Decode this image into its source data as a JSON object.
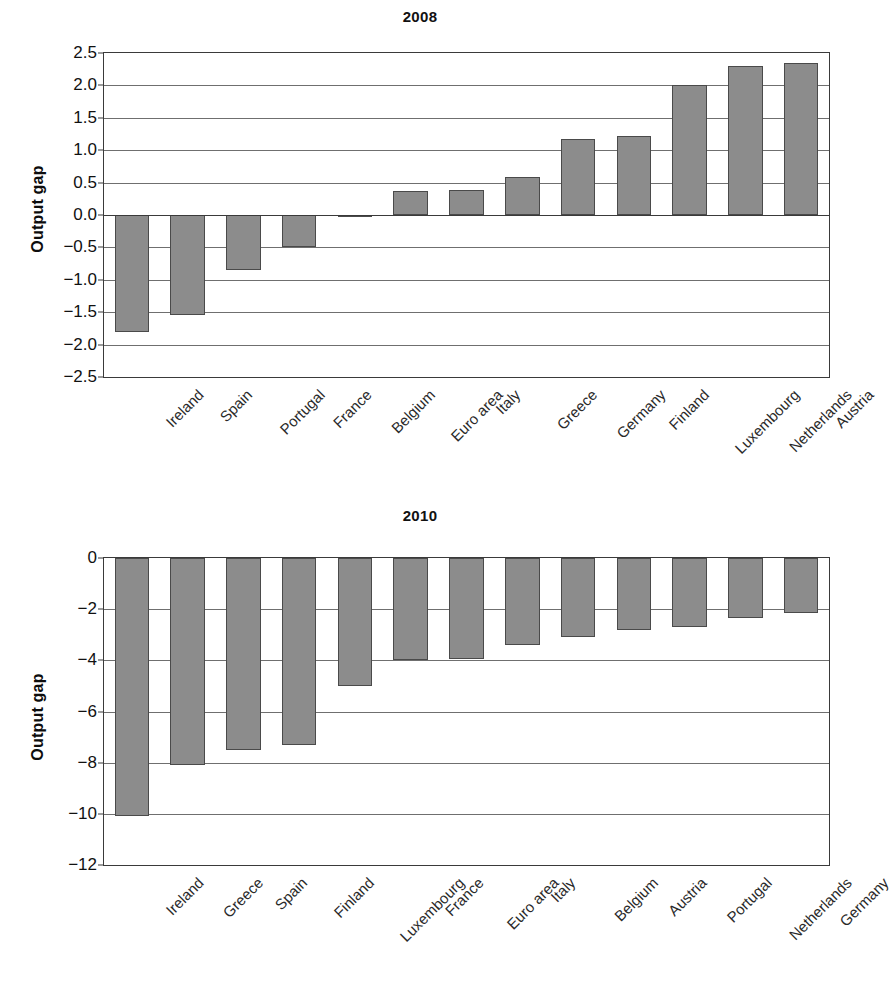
{
  "figure": {
    "background_color": "#ffffff",
    "bar_fill_color": "#8c8c8c",
    "bar_border_color": "#4a4a4a",
    "axis_color": "#3a3a3a",
    "grid_color": "#6f6f6f"
  },
  "charts": [
    {
      "id": "chart-2008",
      "title": "2008",
      "ylabel": "Output gap",
      "yticks": [
        "2.5",
        "2.0",
        "1.5",
        "1.0",
        "0.5",
        "0.0",
        "−0.5",
        "−1.0",
        "−1.5",
        "−2.0",
        "−2.5"
      ]
    },
    {
      "id": "chart-2010",
      "title": "2010",
      "ylabel": "Output gap",
      "yticks": [
        "0",
        "−2",
        "−4",
        "−6",
        "−8",
        "−10",
        "−12"
      ]
    }
  ],
  "chart_data": [
    {
      "type": "bar",
      "title": "2008",
      "xlabel": "",
      "ylabel": "Output gap",
      "ylim": [
        -2.5,
        2.5
      ],
      "ytick_values": [
        2.5,
        2.0,
        1.5,
        1.0,
        0.5,
        0.0,
        -0.5,
        -1.0,
        -1.5,
        -2.0,
        -2.5
      ],
      "grid": true,
      "legend": "none",
      "categories": [
        "Ireland",
        "Spain",
        "Portugal",
        "France",
        "Belgium",
        "Euro area",
        "Italy",
        "Greece",
        "Germany",
        "Finland",
        "Luxembourg",
        "Netherlands",
        "Austria"
      ],
      "values": [
        -1.8,
        -1.55,
        -0.85,
        -0.5,
        -0.02,
        0.37,
        0.38,
        0.58,
        1.18,
        1.22,
        2.0,
        2.3,
        2.35
      ]
    },
    {
      "type": "bar",
      "title": "2010",
      "xlabel": "",
      "ylabel": "Output gap",
      "ylim": [
        -12,
        0
      ],
      "ytick_values": [
        0,
        -2,
        -4,
        -6,
        -8,
        -10,
        -12
      ],
      "grid": true,
      "legend": "none",
      "categories": [
        "Ireland",
        "Greece",
        "Spain",
        "Finland",
        "Luxembourg",
        "France",
        "Euro area",
        "Italy",
        "Belgium",
        "Austria",
        "Portugal",
        "Netherlands",
        "Germany"
      ],
      "values": [
        -10.1,
        -8.1,
        -7.5,
        -7.3,
        -5.0,
        -4.0,
        -3.95,
        -3.4,
        -3.1,
        -2.8,
        -2.7,
        -2.35,
        -2.15
      ]
    }
  ]
}
